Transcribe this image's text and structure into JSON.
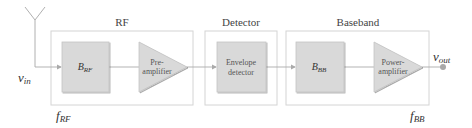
{
  "diagram": {
    "sections": [
      {
        "id": "rf",
        "label": "RF"
      },
      {
        "id": "detector",
        "label": "Detector"
      },
      {
        "id": "baseband",
        "label": "Baseband"
      }
    ],
    "blocks": {
      "b_rf": {
        "main": "B",
        "sub": "RF"
      },
      "preamp": {
        "line1": "Pre-",
        "line2": "amplifier"
      },
      "envelope": {
        "line1": "Envelope",
        "line2": "detector"
      },
      "b_bb": {
        "main": "B",
        "sub": "BB"
      },
      "poweramp": {
        "line1": "Power-",
        "line2": "amplifier"
      }
    },
    "signals": {
      "vin": {
        "main": "v",
        "sub": "in"
      },
      "vout": {
        "main": "v",
        "sub": "out"
      },
      "f_rf": {
        "main": "f",
        "sub": "RF"
      },
      "f_bb": {
        "main": "f",
        "sub": "BB"
      }
    },
    "colors": {
      "block_fill": "#d9d9d9",
      "container_stroke": "#d0d0d0",
      "line": "#a8a8a8",
      "output_dot": "#a0a0a0"
    }
  }
}
